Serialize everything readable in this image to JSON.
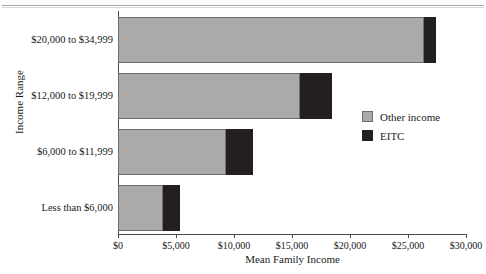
{
  "chart_data": {
    "type": "bar",
    "orientation": "horizontal",
    "stacked": true,
    "title": "",
    "xlabel": "Mean Family Income",
    "ylabel": "Income Range",
    "xlim": [
      0,
      30000
    ],
    "grid": false,
    "legend_position": "right",
    "categories": [
      "$20,000 to $34,999",
      "$12,000 to $19,999",
      "$6,000 to $11,999",
      "Less than $6,000"
    ],
    "series": [
      {
        "name": "Other income",
        "color": "#aaaaaa",
        "values": [
          26400,
          15700,
          9300,
          3880
        ]
      },
      {
        "name": "EITC",
        "color": "#231f20",
        "values": [
          1000,
          2750,
          2350,
          1470
        ]
      }
    ],
    "totals": [
      27400,
      18450,
      11650,
      5350
    ],
    "xticks": [
      0,
      5000,
      10000,
      15000,
      20000,
      25000,
      30000
    ],
    "xtick_labels": [
      "$0",
      "$5,000",
      "$10,000",
      "$15,000",
      "$20,000",
      "$25,000",
      "$30,000"
    ]
  }
}
